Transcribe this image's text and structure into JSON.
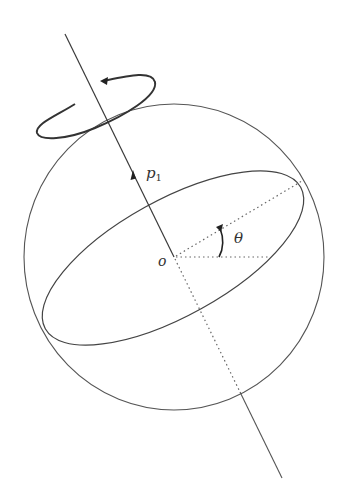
{
  "figure": {
    "labels": {
      "axis_vector": "p",
      "axis_subscript": "1",
      "origin": "o",
      "angle": "θ"
    },
    "colors": {
      "stroke": "#4a4a4a",
      "axis": "#3a3a3a",
      "dotted": "#666666",
      "background": "#ffffff"
    }
  }
}
